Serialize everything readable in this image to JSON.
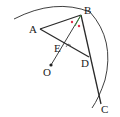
{
  "diagram": {
    "type": "geometry",
    "labels": {
      "A": "A",
      "B": "B",
      "C": "C",
      "D": "D",
      "E": "E",
      "O": "O"
    },
    "points": {
      "A": [
        40,
        29
      ],
      "B": [
        81,
        15
      ],
      "C": [
        100,
        103
      ],
      "D": [
        89,
        57
      ],
      "E": [
        62,
        46
      ],
      "O": [
        51,
        65
      ]
    },
    "segments": [
      "AB",
      "AD",
      "BC",
      "BO"
    ],
    "arc": "circle centered at O through B and C",
    "angle_marks": "two equal angle marks at B (ABE = EBD)",
    "colors": {
      "line": "#2a2a2a",
      "angle_mark": "#e0304a",
      "bisector": "#3a8a3a"
    }
  }
}
